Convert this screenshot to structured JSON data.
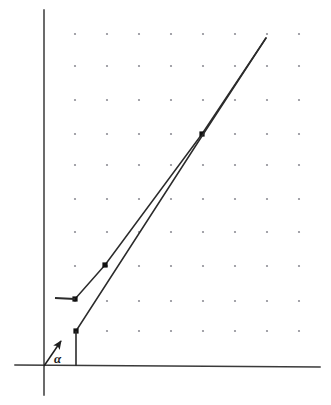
{
  "figure": {
    "type": "line-diagram",
    "background_color": "#ffffff",
    "width": 331,
    "height": 405,
    "stroke_color": "#2b2b2b",
    "axis_color": "#3a3a3a",
    "dot_color": "#8f8f96",
    "labels": {
      "angle_symbol": "α"
    }
  },
  "chart_data": {
    "type": "line",
    "title": "",
    "xlabel": "",
    "ylabel": "",
    "grid": "dot-lattice",
    "legend": "none",
    "axes": {
      "y_axis": {
        "x": 44,
        "y_top": 10,
        "y_bottom": 395
      },
      "x_axis": {
        "y_left": 365,
        "y_right": 367,
        "x_left": 15,
        "x_right": 320
      },
      "origin": {
        "x": 44,
        "y": 365
      }
    },
    "grid_dots": {
      "columns_x": [
        75,
        107,
        139,
        171,
        203,
        235,
        267,
        299
      ],
      "rows_y": [
        34,
        66,
        100,
        134,
        165,
        199,
        232,
        266,
        301,
        331
      ],
      "radius": 1.1
    },
    "series": [
      {
        "name": "upper-left-line",
        "points": [
          [
            75,
            299
          ],
          [
            105,
            265
          ],
          [
            202,
            134
          ],
          [
            266,
            38
          ]
        ],
        "markers": [
          [
            75,
            299
          ],
          [
            105,
            265
          ],
          [
            202,
            134
          ]
        ]
      },
      {
        "name": "lower-right-line",
        "points": [
          [
            76,
            331
          ],
          [
            202,
            136
          ],
          [
            266,
            38
          ]
        ],
        "markers": [
          [
            76,
            331
          ]
        ]
      }
    ],
    "annotations": [
      {
        "name": "horizontal-tick",
        "kind": "segment",
        "from": [
          55,
          298
        ],
        "to": [
          75,
          299
        ]
      },
      {
        "name": "vertical-tick",
        "kind": "segment",
        "from": [
          76,
          331
        ],
        "to": [
          76,
          366
        ]
      },
      {
        "name": "angle-arrow",
        "kind": "arrow",
        "from": [
          44,
          366
        ],
        "to": [
          61,
          341
        ]
      },
      {
        "name": "angle-label",
        "kind": "text",
        "text": "α",
        "at": [
          54,
          352
        ]
      }
    ]
  }
}
